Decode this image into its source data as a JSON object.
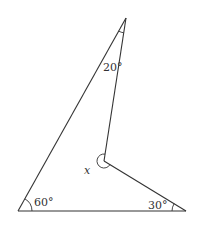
{
  "diagram": {
    "type": "geometry",
    "vertices": {
      "top": {
        "x": 126,
        "y": 18
      },
      "bottom_left": {
        "x": 18,
        "y": 211
      },
      "bottom_right": {
        "x": 186,
        "y": 211
      },
      "interior": {
        "x": 104,
        "y": 161
      }
    },
    "labels": {
      "top_angle": "20°",
      "bottom_left_angle": "60°",
      "bottom_right_angle": "30°",
      "interior_angle": "x"
    },
    "colors": {
      "line": "#333333",
      "background": "#ffffff"
    }
  }
}
